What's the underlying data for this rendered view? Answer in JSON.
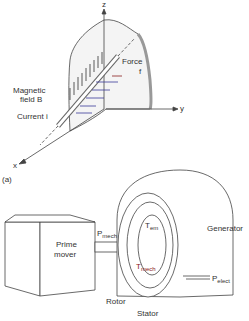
{
  "figure_a": {
    "axes": {
      "z": "z",
      "y": "y",
      "x": "x"
    },
    "labels": {
      "force": "Force",
      "force_symbol": "f",
      "magnetic_field_line1": "Magnetic",
      "magnetic_field_line2": "field B",
      "current": "Current i"
    },
    "caption": "(a)"
  },
  "figure_b": {
    "labels": {
      "prime_mover_line1": "Prime",
      "prime_mover_line2": "mover",
      "p_mech": "P",
      "p_mech_sub": "mech",
      "t_em": "T",
      "t_em_sub": "em",
      "t_mech": "T",
      "t_mech_sub": "mech",
      "generator": "Generator",
      "p_elect": "P",
      "p_elect_sub": "elect",
      "rotor": "Rotor",
      "stator": "Stator"
    },
    "caption": "(b)"
  },
  "colors": {
    "line": "#444444",
    "accent_red": "#8a2020",
    "accent_blue": "#3a3a9a"
  }
}
